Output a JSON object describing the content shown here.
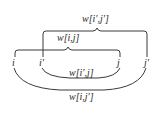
{
  "diagram": {
    "nodes": [
      {
        "id": "i",
        "label": "i",
        "x": 14,
        "y": 57
      },
      {
        "id": "i_prime",
        "label": "i'",
        "x": 40,
        "y": 57
      },
      {
        "id": "j",
        "label": "j",
        "x": 119,
        "y": 57
      },
      {
        "id": "j_prime",
        "label": "j'",
        "x": 145,
        "y": 57
      }
    ],
    "braces": [
      {
        "id": "w_ip_jp",
        "label": "w[i',j']",
        "from": "i_prime",
        "to": "j_prime",
        "position": "above",
        "level": "outer"
      },
      {
        "id": "w_i_j",
        "label": "w[i,j]",
        "from": "i",
        "to": "j",
        "position": "above",
        "level": "inner"
      }
    ],
    "arcs": [
      {
        "id": "w_ip_j",
        "label": "w[i',j]",
        "from": "i_prime",
        "to": "j",
        "position": "below",
        "level": "inner"
      },
      {
        "id": "w_i_jp",
        "label": "w[i,j']",
        "from": "i",
        "to": "j_prime",
        "position": "below",
        "level": "outer"
      }
    ],
    "colors": {
      "stroke": "#3a3a3a",
      "text": "#2a2a2a",
      "background": "#ffffff"
    }
  }
}
